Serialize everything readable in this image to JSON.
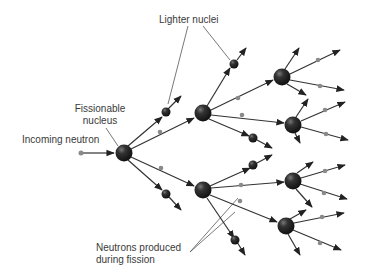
{
  "diagram": {
    "labels": {
      "lighter_nuclei": "Lighter nuclei",
      "fissionable_line1": "Fissionable",
      "fissionable_line2": "nucleus",
      "incoming_neutron": "Incoming neutron",
      "neutrons_line1": "Neutrons produced",
      "neutrons_line2": "during fission"
    },
    "colors": {
      "nucleus": "#2a2a2a",
      "neutron": "#8a8a8a",
      "line": "#333333",
      "leader": "#555555",
      "text": "#3a3a3a"
    }
  }
}
